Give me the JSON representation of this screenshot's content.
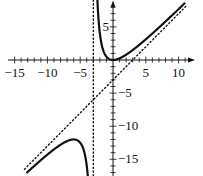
{
  "chart_data": {
    "type": "line",
    "title": "",
    "xlabel": "",
    "ylabel": "",
    "function": "f(x) = x^2 / (x + 3)",
    "xlim": [
      -16,
      12.5
    ],
    "ylim": [
      -18,
      9
    ],
    "grid": false,
    "legend": null,
    "x_ticks": [
      -15,
      -10,
      -5,
      5,
      10
    ],
    "y_ticks": [
      5,
      -5,
      -10,
      -15
    ],
    "x_tick_labels": [
      "−15",
      "−10",
      "−5",
      "5",
      "10"
    ],
    "y_tick_labels": [
      "5",
      "−5",
      "−10",
      "−15"
    ],
    "asymptotes": [
      {
        "type": "vertical",
        "x": -3,
        "style": "dotted"
      },
      {
        "type": "oblique",
        "equation": "y = x - 3",
        "style": "dotted"
      }
    ],
    "series": [
      {
        "name": "left branch",
        "style": "solid",
        "x": [
          -14,
          -12,
          -10,
          -8,
          -6,
          -5,
          -4,
          -3.5
        ],
        "y": [
          -17.8,
          -16,
          -14.3,
          -12.8,
          -12,
          -12.5,
          -16,
          -24.5
        ]
      },
      {
        "name": "right branch",
        "style": "solid",
        "x": [
          -2.6,
          -2.5,
          -2,
          -1,
          0,
          1,
          2,
          4,
          6,
          8,
          10,
          11
        ],
        "y": [
          16.9,
          12.5,
          4,
          0.5,
          0,
          0.25,
          0.8,
          2.29,
          4,
          5.82,
          7.69,
          8.64
        ]
      }
    ],
    "annotations": [
      {
        "label": "local max",
        "x": -6,
        "y": -12
      },
      {
        "label": "local min",
        "x": 0,
        "y": 0
      }
    ]
  }
}
